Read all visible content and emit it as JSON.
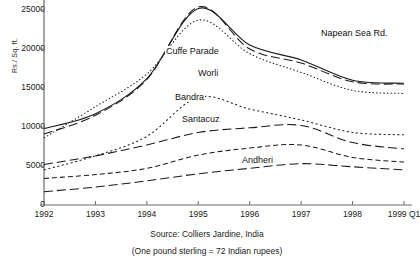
{
  "axes": {
    "ylabel": "Rs./ Sq. ft.",
    "yticks": [
      0,
      5000,
      10000,
      15000,
      20000,
      25000
    ],
    "ytick_labels": [
      "0",
      "5000",
      "10000",
      "15000",
      "20000",
      "25000"
    ],
    "xtick_labels": [
      "1992",
      "1993",
      "1994",
      "1995",
      "1996",
      "1997",
      "1998",
      "1999 Q1"
    ]
  },
  "captions": {
    "source": "Source: Colliers Jardine, India",
    "note": "(One pound sterling = 72 Indian rupees)"
  },
  "series_labels": {
    "napean": "Napean Sea Rd.",
    "cuffe": "Cuffe Parade",
    "worli": "Worli",
    "bandra": "Bandra",
    "santacuz": "Santacuz",
    "andheri": "Andheri"
  },
  "chart_data": {
    "type": "line",
    "title": "",
    "xlabel": "",
    "ylabel": "Rs./ Sq. ft.",
    "xlim": [
      1992,
      1999
    ],
    "ylim": [
      0,
      25600
    ],
    "grid": false,
    "legend": "inline-annotations",
    "x": [
      1992,
      1993,
      1994,
      1995,
      1996,
      1997,
      1998,
      1999
    ],
    "xtick_labels": [
      "1992",
      "1993",
      "1994",
      "1995",
      "1996",
      "1997",
      "1998",
      "1999 Q1"
    ],
    "series": [
      {
        "name": "Napean Sea Rd.",
        "style": "solid",
        "values": [
          9800,
          11700,
          16200,
          25200,
          20500,
          18600,
          16000,
          15600
        ]
      },
      {
        "name": "Cuffe Parade",
        "style": "long-dash",
        "values": [
          9100,
          11500,
          16100,
          25400,
          20000,
          18200,
          15800,
          15500
        ]
      },
      {
        "name": "Worli",
        "style": "dotted-fine",
        "values": [
          8600,
          12600,
          16800,
          23700,
          19400,
          17000,
          14700,
          14300
        ]
      },
      {
        "name": "Bandra",
        "style": "dotted",
        "values": [
          4500,
          6300,
          8800,
          13800,
          12300,
          10900,
          9300,
          9000
        ]
      },
      {
        "name": "Santacuz",
        "style": "long-dash",
        "values": [
          5200,
          6300,
          7700,
          9300,
          9900,
          10200,
          8000,
          7200
        ]
      },
      {
        "name": "Andheri",
        "style": "short-dash",
        "values": [
          3400,
          3900,
          4700,
          6400,
          7300,
          7700,
          6100,
          5500
        ]
      },
      {
        "name": "Andheri-lower",
        "style": "long-dash",
        "values": [
          1700,
          2300,
          3100,
          4000,
          4700,
          5300,
          4900,
          4500
        ]
      }
    ]
  }
}
